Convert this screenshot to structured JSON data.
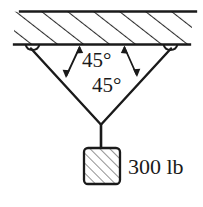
{
  "figure": {
    "background_color": "#ffffff",
    "line_color": "#1a1a1a",
    "hatch_color": "#2b2b2b"
  },
  "ceiling": {
    "name": "hatched support ceiling",
    "hatch_direction": "up-right",
    "hatch_count": 11
  },
  "supports": [
    {
      "name": "left-eyelet",
      "x": 32,
      "y": 45
    },
    {
      "name": "right-eyelet",
      "x": 170,
      "y": 45
    }
  ],
  "cables": [
    {
      "name": "left-cable",
      "from": "left-eyelet",
      "to": "junction"
    },
    {
      "name": "right-cable",
      "from": "right-eyelet",
      "to": "junction"
    },
    {
      "name": "vertical-cable",
      "from": "junction",
      "to": "block"
    }
  ],
  "angles": [
    {
      "id": "angle-left",
      "label": "45°",
      "value": 45,
      "unit": "degrees",
      "measured_between": "ceiling and left cable"
    },
    {
      "id": "angle-right",
      "label": "45°",
      "value": 45,
      "unit": "degrees",
      "measured_between": "ceiling and right cable"
    }
  ],
  "block": {
    "name": "suspended block",
    "hatch_direction": "up-right",
    "weight_label": "300 lb",
    "weight_value": 300,
    "weight_unit": "lb"
  }
}
